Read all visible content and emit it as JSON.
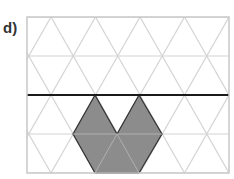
{
  "label": "d)",
  "grid": {
    "left": 27,
    "right": 229,
    "top": 17,
    "bottom": 173,
    "row_height": 39,
    "tri_width": 44.5,
    "line_color": "#d4d4d4",
    "border_color": "#c8c8c8"
  },
  "mirror_line": {
    "y": 95,
    "x1": 27,
    "x2": 229,
    "color": "#1a1a1a"
  },
  "shape": {
    "points": "95,95 73,134 95,173 139,173 162,134 139,95 117,134",
    "fill": "#8c8c8c",
    "stroke": "#333333"
  }
}
